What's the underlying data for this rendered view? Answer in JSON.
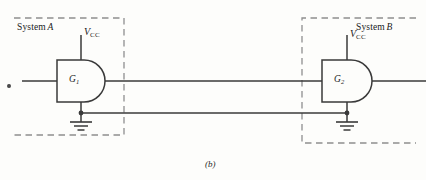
{
  "figure": {
    "caption": "(b)",
    "background_color": "#fdfdfb",
    "line_color": "#3a3a3a",
    "dash_color": "#8c8c8c"
  },
  "systems": [
    {
      "name": "system-a",
      "label_text": "System",
      "label_italic": "A",
      "box": {
        "x": 14,
        "y": 18,
        "width": 110,
        "height": 117
      }
    },
    {
      "name": "system-b",
      "label_text": "System",
      "label_italic": "B",
      "box": {
        "x": 302,
        "y": 18,
        "width": 114,
        "height": 125
      }
    }
  ],
  "gates": [
    {
      "name": "gate-g1",
      "label": "G",
      "subscript": "1",
      "supply_label": "V",
      "supply_subscript": "CC",
      "x": 57,
      "y": 60,
      "width": 48,
      "height": 42
    },
    {
      "name": "gate-g2",
      "label": "G",
      "subscript": "2",
      "supply_label": "V",
      "supply_subscript": "CC",
      "x": 322,
      "y": 60,
      "width": 50,
      "height": 42
    }
  ],
  "nets": {
    "signal_wire_y": 81,
    "ground_return_wire_y": 113,
    "grounds": [
      {
        "name": "ground-symbol-a",
        "x": 81,
        "y": 122
      },
      {
        "name": "ground-symbol-b",
        "x": 347,
        "y": 122
      }
    ],
    "junctions": [
      {
        "name": "junction-dot-a",
        "x": 81,
        "y": 113
      },
      {
        "name": "junction-dot-b",
        "x": 347,
        "y": 113
      }
    ]
  }
}
